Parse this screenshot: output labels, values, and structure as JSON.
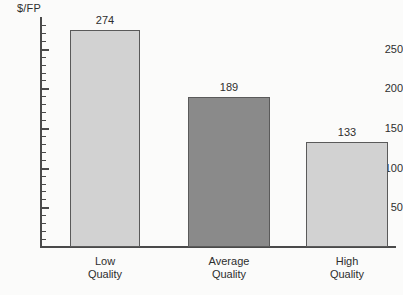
{
  "chart_data": {
    "type": "bar",
    "title": "",
    "subtitle": "",
    "xlabel": "",
    "ylabel": "$/FP",
    "categories": [
      "Low Quality",
      "Average Quality",
      "High Quality"
    ],
    "category_lines": [
      [
        "Low",
        "Quality"
      ],
      [
        "Average",
        "Quality"
      ],
      [
        "High",
        "Quality"
      ]
    ],
    "values": [
      274,
      189,
      133
    ],
    "value_labels": [
      "274",
      "189",
      "133"
    ],
    "ylim": [
      0,
      290
    ],
    "y_major_ticks": [
      50,
      100,
      150,
      200,
      250
    ],
    "y_major_tick_labels": [
      "50",
      "100",
      "150",
      "200",
      "250"
    ],
    "y_minor_tick_interval": 10,
    "grid": false,
    "legend": false,
    "legend_position": "none",
    "bar_colors": [
      "#d2d2d2",
      "#8a8a8a",
      "#d2d2d2"
    ],
    "bar_edge_color": "#5a5a5a",
    "axis_color": "#4a4a4a",
    "text_color": "#2e2e2e",
    "background_color": "#fbfbfa"
  }
}
